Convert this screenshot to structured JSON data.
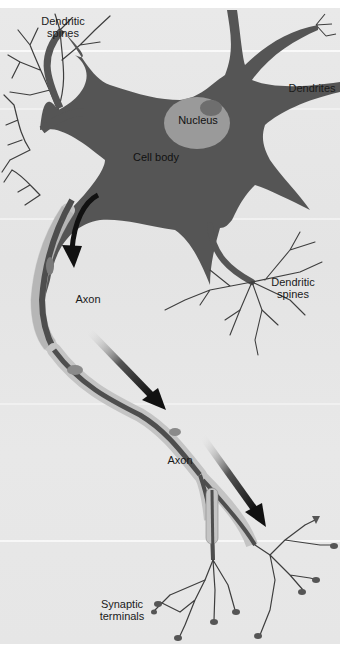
{
  "diagram": {
    "labels": {
      "dendritic_spines_top": "Dendritic\nspines",
      "dendrites": "Dendrites",
      "nucleus": "Nucleus",
      "cell_body": "Cell body",
      "dendritic_spines_right": "Dendritic\nspines",
      "axon_upper": "Axon",
      "axon_lower": "Axon",
      "synaptic_terminals": "Synaptic\nterminals"
    },
    "colors": {
      "background": "#e7e7e7",
      "cell_body": "#555555",
      "nucleus": "#9a9a9a",
      "nucleolus": "#6e6e6e",
      "myelin": "#c4c4c4",
      "axon_core": "#4e4e4e",
      "arrow": "#111111",
      "branch": "#3e3e3e"
    }
  }
}
